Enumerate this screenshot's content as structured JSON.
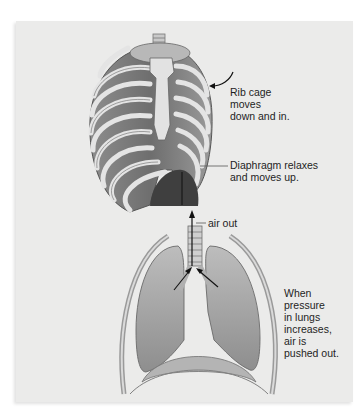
{
  "figure": {
    "background_color": "#ebebea",
    "labels": {
      "rib_cage": [
        "Rib cage",
        "moves",
        "down and in."
      ],
      "diaphragm": [
        "Diaphragm relaxes",
        "and moves up."
      ],
      "air_out": "air out",
      "lungs": [
        "When",
        "pressure",
        "in lungs",
        "increases,",
        "air is",
        "pushed out."
      ]
    },
    "illustrations": {
      "top": "rib-cage",
      "bottom": "lungs"
    }
  }
}
